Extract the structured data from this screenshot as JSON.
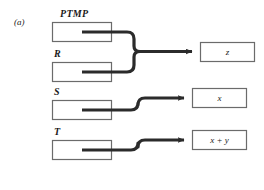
{
  "figure": {
    "panel_label": "(a)",
    "stroke_color": "#2b2b2b",
    "box_border_color": "#6b6b6b",
    "background_color": "#ffffff",
    "inputs": [
      {
        "label": "PTMP",
        "name": "input-box-ptmp"
      },
      {
        "label": "R",
        "name": "input-box-r"
      },
      {
        "label": "S",
        "name": "input-box-s"
      },
      {
        "label": "T",
        "name": "input-box-t"
      }
    ],
    "outputs": [
      {
        "label": "z",
        "name": "output-box-z"
      },
      {
        "label": "x",
        "name": "output-box-x"
      },
      {
        "label": "x + y",
        "name": "output-box-x-plus-y"
      }
    ],
    "connections": [
      {
        "from": "PTMP",
        "to": "z",
        "style": "merged-brace"
      },
      {
        "from": "R",
        "to": "z",
        "style": "merged-brace"
      },
      {
        "from": "S",
        "to": "x",
        "style": "step-up"
      },
      {
        "from": "T",
        "to": "x + y",
        "style": "step-up"
      }
    ]
  }
}
